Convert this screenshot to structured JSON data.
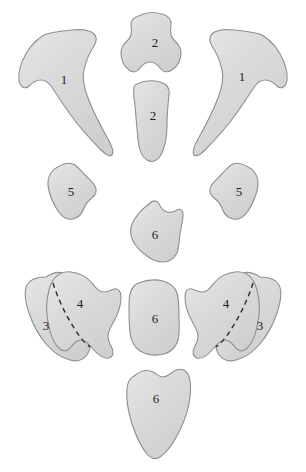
{
  "figure": {
    "background_color": "#ffffff",
    "shape_fill": "#d6d6d6",
    "shape_fill_highlight": "#e4e4e4",
    "shape_stroke": "#8f8f8f",
    "divider_color": "#2b2b2b",
    "label_color": "#1c1c1c",
    "divider_dash": "5,4",
    "divider_width": "1.4"
  },
  "shapes": [
    {
      "id": "clavicle-left",
      "label": "1",
      "label_x": 64,
      "label_y": 81,
      "side": "left",
      "path": "M 44 35 C 34 41 26 52 22 62 C 19 70 18 79 20 84 C 22 88 26 89 29 86 C 32 83 36 80 41 80 C 45 80 48 82 51 86 C 56 93 62 103 70 114 C 80 128 92 141 101 150 C 106 155 110 157 112 155 C 114 152 112 146 108 139 C 100 125 93 111 88 98 C 84 88 82 79 84 70 C 86 60 90 52 94 46 C 97 41 97 37 94 34 C 90 30 82 29 72 30 C 61 31 51 32 44 35 Z"
    },
    {
      "id": "clavicle-right",
      "label": "1",
      "label_x": 242,
      "label_y": 78,
      "side": "right",
      "path": "M 262 35 C 272 41 280 52 284 62 C 287 70 288 79 286 84 C 284 88 280 89 277 86 C 274 83 270 80 265 80 C 261 80 258 82 255 86 C 250 93 244 103 236 114 C 226 128 214 141 205 150 C 200 155 196 157 194 155 C 192 152 194 146 198 139 C 206 125 213 111 218 98 C 222 88 224 79 222 70 C 220 60 216 52 212 46 C 209 41 209 37 212 34 C 216 30 224 29 234 30 C 245 31 255 32 262 35 Z"
    },
    {
      "id": "vertebra-upper",
      "label": "2",
      "label_x": 155,
      "label_y": 44,
      "side": "center",
      "path": "M 141 15 C 147 12 155 12 162 14 C 169 16 172 20 171 26 C 170 31 170 36 174 40 C 178 44 181 47 181 53 C 181 60 178 66 172 70 C 167 73 163 72 160 68 C 157 64 154 62 150 62 C 146 62 143 64 140 68 C 137 72 133 73 129 70 C 124 66 121 60 121 53 C 121 47 124 44 128 40 C 132 36 132 31 131 26 C 130 20 134 17 141 15 Z"
    },
    {
      "id": "sternum-body",
      "label": "2",
      "label_x": 153,
      "label_y": 117,
      "side": "center",
      "path": "M 137 84 C 143 81 152 80 160 82 C 167 84 170 88 169 95 C 168 104 167 115 167 126 C 167 137 165 147 161 155 C 157 161 152 163 147 160 C 142 157 139 150 138 140 C 137 129 136 117 135 106 C 134 97 133 90 134 87 C 135 85 136 84 137 84 Z"
    },
    {
      "id": "rib-fragment-left",
      "label": "5",
      "label_x": 71,
      "label_y": 193,
      "side": "left",
      "path": "M 58 167 C 64 163 70 162 75 165 C 79 168 82 172 86 176 C 90 180 93 182 95 186 C 97 190 96 194 93 197 C 89 200 86 203 84 208 C 82 214 78 218 73 219 C 67 220 62 217 58 211 C 54 205 51 198 49 191 C 47 183 48 177 51 173 C 53 170 55 168 58 167 Z"
    },
    {
      "id": "rib-fragment-right",
      "label": "5",
      "label_x": 239,
      "label_y": 193,
      "side": "right",
      "path": "M 248 167 C 242 163 236 162 231 165 C 227 168 224 172 220 176 C 216 180 213 182 211 186 C 209 190 210 194 213 197 C 217 200 220 203 222 208 C 224 214 228 218 233 219 C 239 220 244 217 248 211 C 252 205 255 198 257 191 C 259 183 258 177 255 173 C 253 170 251 168 248 167 Z"
    },
    {
      "id": "vertebra-mid",
      "label": "6",
      "label_x": 155,
      "label_y": 236,
      "side": "center",
      "path": "M 150 203 C 153 200 157 200 159 204 C 161 208 163 211 167 212 C 171 213 174 212 177 210 C 180 208 183 210 183 215 C 183 221 181 227 180 234 C 179 241 179 248 177 253 C 174 259 169 262 163 262 C 157 262 152 260 147 256 C 141 252 136 247 133 241 C 130 235 130 229 132 224 C 134 219 137 216 140 212 C 143 208 147 206 150 203 Z"
    },
    {
      "id": "vertebra-lower",
      "label": "6",
      "label_x": 155,
      "label_y": 320,
      "side": "center",
      "path": "M 139 283 C 146 280 155 279 163 281 C 170 283 175 287 177 293 C 179 300 179 308 179 316 C 179 325 180 333 178 340 C 176 347 171 352 164 354 C 156 356 147 355 140 351 C 134 347 131 341 130 333 C 129 324 129 314 129 305 C 129 296 131 289 134 286 C 136 284 137 283 139 283 Z"
    },
    {
      "id": "sacrum",
      "label": "6",
      "label_x": 156,
      "label_y": 400,
      "side": "center",
      "path": "M 134 376 C 140 371 147 369 153 372 C 157 374 159 377 163 377 C 167 377 170 374 174 371 C 179 368 185 369 188 374 C 191 380 191 388 190 397 C 189 408 185 420 179 432 C 173 444 166 453 160 457 C 155 460 151 459 147 454 C 141 447 136 436 132 424 C 128 411 126 398 127 388 C 128 381 130 378 134 376 Z"
    },
    {
      "id": "scapula-left-posterior",
      "label": "3",
      "label_x": 46,
      "label_y": 327,
      "side": "left",
      "path": "M 46 277 C 53 272 61 271 68 275 C 74 279 77 286 80 294 C 84 305 88 317 90 329 C 92 340 91 349 87 355 C 83 360 77 362 70 360 C 62 358 54 353 47 345 C 39 336 33 325 29 313 C 25 301 24 291 27 285 C 30 279 37 277 46 277 Z"
    },
    {
      "id": "scapula-left-anterior",
      "label": "4",
      "label_x": 80,
      "label_y": 305,
      "side": "left",
      "path": "M 52 282 C 56 275 63 271 71 272 C 80 273 87 277 92 283 C 96 288 99 292 104 292 C 108 292 111 290 114 289 C 118 288 121 291 121 297 C 121 305 118 314 114 321 C 111 327 108 331 108 336 C 108 341 110 344 112 348 C 114 353 113 357 109 358 C 104 359 98 355 93 349 C 89 344 85 340 81 340 C 77 340 74 343 71 347 C 68 351 64 352 60 349 C 55 345 51 337 49 327 C 46 315 46 301 49 290 C 50 286 51 284 52 282 Z"
    },
    {
      "id": "scapula-right-posterior",
      "label": "3",
      "label_x": 260,
      "label_y": 327,
      "side": "right",
      "path": "M 260 277 C 253 272 245 271 238 275 C 232 279 229 286 226 294 C 222 305 218 317 216 329 C 214 340 215 349 219 355 C 223 360 229 362 236 360 C 244 358 252 353 259 345 C 267 336 273 325 277 313 C 281 301 282 291 279 285 C 276 279 269 277 260 277 Z"
    },
    {
      "id": "scapula-right-anterior",
      "label": "4",
      "label_x": 226,
      "label_y": 305,
      "side": "right",
      "path": "M 254 282 C 250 275 243 271 235 272 C 226 273 219 277 214 283 C 210 288 207 292 202 292 C 198 292 195 290 192 289 C 188 288 185 291 185 297 C 185 305 188 314 192 321 C 195 327 198 331 198 336 C 198 341 196 344 194 348 C 192 353 193 357 197 358 C 202 359 208 355 213 349 C 217 344 221 340 225 340 C 229 340 232 343 235 347 C 238 351 242 352 246 349 C 251 345 255 337 257 327 C 260 315 260 301 257 290 C 256 286 255 284 254 282 Z"
    }
  ],
  "dividers": [
    {
      "id": "divider-left",
      "path": "M 53 283 C 58 299 66 316 76 331 C 81 339 86 344 90 347"
    },
    {
      "id": "divider-right",
      "path": "M 253 283 C 248 299 240 316 230 331 C 225 339 220 344 216 347"
    }
  ]
}
